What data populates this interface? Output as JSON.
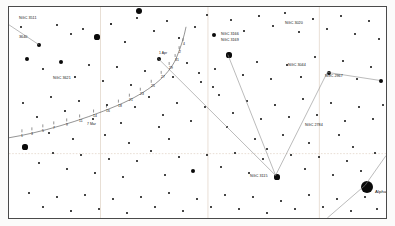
{
  "chart": {
    "kind": "star-chart",
    "title_visible": false,
    "frame": {
      "border_color": "#4a4a4a",
      "background": "#ffffff"
    }
  },
  "colors": {
    "star": "#0a0a0a",
    "grid": "#d9c9b8",
    "track": "#3a3a3a",
    "connector": "#8c8c8c",
    "label": "#111111"
  },
  "deep_sky_labels": [
    {
      "id": "ngc-3511",
      "text": "NGC 3511",
      "x": 10,
      "y": 10
    },
    {
      "id": "n-3640",
      "text": "3640",
      "x": 10,
      "y": 29
    },
    {
      "id": "ngc-3621",
      "text": "NGC 3621",
      "x": 44,
      "y": 70
    },
    {
      "id": "ngc-3166",
      "text": "NGC 3166",
      "x": 212,
      "y": 26
    },
    {
      "id": "ngc-3169",
      "text": "NGC 3169",
      "x": 212,
      "y": 32
    },
    {
      "id": "ngc-3020",
      "text": "NGC 3020",
      "x": 276,
      "y": 15
    },
    {
      "id": "ngc-3044",
      "text": "NGC 3044",
      "x": 279,
      "y": 57
    },
    {
      "id": "ngc-2967",
      "text": "NGC 2967",
      "x": 316,
      "y": 68
    },
    {
      "id": "ngc-2784",
      "text": "NGC 2784",
      "x": 296,
      "y": 117
    },
    {
      "id": "ngc-3115",
      "text": "NGC 3115",
      "x": 241,
      "y": 168
    }
  ],
  "star_names": [
    {
      "id": "alphard",
      "text": "Alphard",
      "x": 366,
      "y": 183
    }
  ],
  "track": {
    "label": "comet-track",
    "epoch_label": {
      "text": "7 Mar",
      "x": 78,
      "y": 116
    },
    "date_ticks": [
      {
        "day": "1",
        "x": 12,
        "y": 128
      },
      {
        "day": "3",
        "x": 22,
        "y": 126
      },
      {
        "day": "5",
        "x": 33,
        "y": 123
      },
      {
        "day": "7",
        "x": 44,
        "y": 120
      },
      {
        "day": "9",
        "x": 57,
        "y": 117
      },
      {
        "day": "11",
        "x": 70,
        "y": 113
      },
      {
        "day": "14",
        "x": 84,
        "y": 108
      },
      {
        "day": "16",
        "x": 97,
        "y": 103
      },
      {
        "day": "18",
        "x": 109,
        "y": 98
      },
      {
        "day": "21",
        "x": 120,
        "y": 92
      },
      {
        "day": "23",
        "x": 131,
        "y": 86
      },
      {
        "day": "25",
        "x": 142,
        "y": 78
      },
      {
        "day": "27",
        "x": 152,
        "y": 69
      },
      {
        "day": "29",
        "x": 160,
        "y": 60
      },
      {
        "day": "31",
        "x": 166,
        "y": 52
      },
      {
        "day": "2",
        "x": 170,
        "y": 44
      },
      {
        "day": "4",
        "x": 174,
        "y": 36
      }
    ],
    "secondary_label": {
      "text": "1 Apr",
      "x": 150,
      "y": 45
    }
  },
  "chart_data": {
    "type": "scatter",
    "xlabel": "Right Ascension",
    "ylabel": "Declination",
    "grid": true,
    "legend": "none",
    "xlim": [
      0,
      379
    ],
    "ylim": [
      0,
      213
    ],
    "series": [
      {
        "name": "stars",
        "note": "x,y in frame pixels; r = plotted radius proportional to brightness",
        "points": [
          {
            "x": 30,
            "y": 38,
            "r": 2.4
          },
          {
            "x": 12,
            "y": 20,
            "r": 1.0
          },
          {
            "x": 48,
            "y": 18,
            "r": 1.0
          },
          {
            "x": 62,
            "y": 27,
            "r": 1.0
          },
          {
            "x": 74,
            "y": 22,
            "r": 1.1
          },
          {
            "x": 88,
            "y": 30,
            "r": 2.6
          },
          {
            "x": 102,
            "y": 17,
            "r": 0.8
          },
          {
            "x": 116,
            "y": 35,
            "r": 0.9
          },
          {
            "x": 128,
            "y": 11,
            "r": 1.0
          },
          {
            "x": 130,
            "y": 4,
            "r": 3.0
          },
          {
            "x": 145,
            "y": 24,
            "r": 1.0
          },
          {
            "x": 158,
            "y": 14,
            "r": 1.0
          },
          {
            "x": 170,
            "y": 31,
            "r": 0.9
          },
          {
            "x": 186,
            "y": 20,
            "r": 1.2
          },
          {
            "x": 198,
            "y": 8,
            "r": 1.0
          },
          {
            "x": 205,
            "y": 28,
            "r": 2.2
          },
          {
            "x": 222,
            "y": 13,
            "r": 1.0
          },
          {
            "x": 235,
            "y": 24,
            "r": 1.1
          },
          {
            "x": 250,
            "y": 9,
            "r": 0.9
          },
          {
            "x": 264,
            "y": 19,
            "r": 1.0
          },
          {
            "x": 276,
            "y": 6,
            "r": 1.2
          },
          {
            "x": 290,
            "y": 25,
            "r": 1.0
          },
          {
            "x": 304,
            "y": 12,
            "r": 0.9
          },
          {
            "x": 318,
            "y": 22,
            "r": 1.1
          },
          {
            "x": 332,
            "y": 9,
            "r": 1.0
          },
          {
            "x": 346,
            "y": 27,
            "r": 1.2
          },
          {
            "x": 360,
            "y": 14,
            "r": 1.0
          },
          {
            "x": 370,
            "y": 32,
            "r": 1.4
          },
          {
            "x": 18,
            "y": 52,
            "r": 2.0
          },
          {
            "x": 34,
            "y": 62,
            "r": 1.0
          },
          {
            "x": 52,
            "y": 55,
            "r": 2.2
          },
          {
            "x": 66,
            "y": 70,
            "r": 0.9
          },
          {
            "x": 80,
            "y": 58,
            "r": 1.0
          },
          {
            "x": 94,
            "y": 74,
            "r": 1.1
          },
          {
            "x": 108,
            "y": 60,
            "r": 0.9
          },
          {
            "x": 122,
            "y": 78,
            "r": 1.0
          },
          {
            "x": 136,
            "y": 64,
            "r": 1.1
          },
          {
            "x": 150,
            "y": 52,
            "r": 2.0
          },
          {
            "x": 164,
            "y": 70,
            "r": 1.0
          },
          {
            "x": 178,
            "y": 56,
            "r": 1.0
          },
          {
            "x": 192,
            "y": 75,
            "r": 1.0
          },
          {
            "x": 206,
            "y": 62,
            "r": 1.2
          },
          {
            "x": 220,
            "y": 48,
            "r": 2.6
          },
          {
            "x": 234,
            "y": 68,
            "r": 0.9
          },
          {
            "x": 248,
            "y": 55,
            "r": 1.0
          },
          {
            "x": 262,
            "y": 72,
            "r": 1.0
          },
          {
            "x": 278,
            "y": 58,
            "r": 1.1
          },
          {
            "x": 292,
            "y": 70,
            "r": 0.9
          },
          {
            "x": 306,
            "y": 50,
            "r": 1.0
          },
          {
            "x": 320,
            "y": 66,
            "r": 2.4
          },
          {
            "x": 334,
            "y": 54,
            "r": 1.0
          },
          {
            "x": 348,
            "y": 72,
            "r": 1.0
          },
          {
            "x": 362,
            "y": 60,
            "r": 1.1
          },
          {
            "x": 372,
            "y": 74,
            "r": 2.2
          },
          {
            "x": 14,
            "y": 96,
            "r": 1.0
          },
          {
            "x": 28,
            "y": 110,
            "r": 1.0
          },
          {
            "x": 42,
            "y": 90,
            "r": 1.1
          },
          {
            "x": 56,
            "y": 104,
            "r": 0.9
          },
          {
            "x": 70,
            "y": 94,
            "r": 1.0
          },
          {
            "x": 84,
            "y": 112,
            "r": 1.0
          },
          {
            "x": 98,
            "y": 98,
            "r": 0.9
          },
          {
            "x": 112,
            "y": 116,
            "r": 1.0
          },
          {
            "x": 126,
            "y": 100,
            "r": 1.1
          },
          {
            "x": 140,
            "y": 90,
            "r": 1.0
          },
          {
            "x": 154,
            "y": 108,
            "r": 1.0
          },
          {
            "x": 168,
            "y": 96,
            "r": 1.0
          },
          {
            "x": 182,
            "y": 114,
            "r": 1.2
          },
          {
            "x": 196,
            "y": 100,
            "r": 1.0
          },
          {
            "x": 210,
            "y": 88,
            "r": 1.0
          },
          {
            "x": 224,
            "y": 106,
            "r": 1.0
          },
          {
            "x": 238,
            "y": 94,
            "r": 1.0
          },
          {
            "x": 252,
            "y": 112,
            "r": 1.1
          },
          {
            "x": 266,
            "y": 98,
            "r": 0.9
          },
          {
            "x": 280,
            "y": 110,
            "r": 1.0
          },
          {
            "x": 294,
            "y": 92,
            "r": 1.0
          },
          {
            "x": 308,
            "y": 108,
            "r": 1.0
          },
          {
            "x": 322,
            "y": 96,
            "r": 1.1
          },
          {
            "x": 336,
            "y": 114,
            "r": 1.0
          },
          {
            "x": 350,
            "y": 100,
            "r": 1.0
          },
          {
            "x": 364,
            "y": 112,
            "r": 1.2
          },
          {
            "x": 374,
            "y": 98,
            "r": 1.0
          },
          {
            "x": 16,
            "y": 140,
            "r": 2.6
          },
          {
            "x": 30,
            "y": 156,
            "r": 1.0
          },
          {
            "x": 44,
            "y": 146,
            "r": 1.0
          },
          {
            "x": 58,
            "y": 162,
            "r": 1.1
          },
          {
            "x": 72,
            "y": 148,
            "r": 1.0
          },
          {
            "x": 86,
            "y": 166,
            "r": 0.9
          },
          {
            "x": 100,
            "y": 152,
            "r": 1.0
          },
          {
            "x": 114,
            "y": 170,
            "r": 1.0
          },
          {
            "x": 128,
            "y": 154,
            "r": 1.1
          },
          {
            "x": 142,
            "y": 144,
            "r": 1.0
          },
          {
            "x": 156,
            "y": 168,
            "r": 1.0
          },
          {
            "x": 170,
            "y": 150,
            "r": 1.0
          },
          {
            "x": 184,
            "y": 164,
            "r": 2.4
          },
          {
            "x": 198,
            "y": 148,
            "r": 1.0
          },
          {
            "x": 212,
            "y": 160,
            "r": 1.2
          },
          {
            "x": 226,
            "y": 146,
            "r": 1.0
          },
          {
            "x": 240,
            "y": 166,
            "r": 1.0
          },
          {
            "x": 254,
            "y": 152,
            "r": 1.0
          },
          {
            "x": 268,
            "y": 170,
            "r": 2.6
          },
          {
            "x": 282,
            "y": 148,
            "r": 1.0
          },
          {
            "x": 296,
            "y": 162,
            "r": 1.0
          },
          {
            "x": 310,
            "y": 150,
            "r": 1.1
          },
          {
            "x": 324,
            "y": 168,
            "r": 1.0
          },
          {
            "x": 338,
            "y": 154,
            "r": 1.0
          },
          {
            "x": 352,
            "y": 164,
            "r": 1.0
          },
          {
            "x": 366,
            "y": 146,
            "r": 1.2
          },
          {
            "x": 20,
            "y": 186,
            "r": 1.0
          },
          {
            "x": 34,
            "y": 200,
            "r": 1.1
          },
          {
            "x": 48,
            "y": 190,
            "r": 1.0
          },
          {
            "x": 62,
            "y": 204,
            "r": 0.9
          },
          {
            "x": 76,
            "y": 188,
            "r": 1.0
          },
          {
            "x": 90,
            "y": 202,
            "r": 1.0
          },
          {
            "x": 104,
            "y": 192,
            "r": 1.0
          },
          {
            "x": 118,
            "y": 206,
            "r": 1.0
          },
          {
            "x": 132,
            "y": 190,
            "r": 1.1
          },
          {
            "x": 146,
            "y": 200,
            "r": 1.0
          },
          {
            "x": 160,
            "y": 186,
            "r": 1.0
          },
          {
            "x": 174,
            "y": 204,
            "r": 1.0
          },
          {
            "x": 188,
            "y": 192,
            "r": 1.0
          },
          {
            "x": 202,
            "y": 200,
            "r": 1.1
          },
          {
            "x": 216,
            "y": 188,
            "r": 1.0
          },
          {
            "x": 230,
            "y": 202,
            "r": 1.0
          },
          {
            "x": 244,
            "y": 190,
            "r": 1.0
          },
          {
            "x": 258,
            "y": 206,
            "r": 1.0
          },
          {
            "x": 272,
            "y": 194,
            "r": 1.0
          },
          {
            "x": 286,
            "y": 202,
            "r": 1.0
          },
          {
            "x": 300,
            "y": 188,
            "r": 1.0
          },
          {
            "x": 314,
            "y": 200,
            "r": 1.1
          },
          {
            "x": 328,
            "y": 192,
            "r": 1.0
          },
          {
            "x": 342,
            "y": 204,
            "r": 1.0
          },
          {
            "x": 356,
            "y": 190,
            "r": 1.0
          },
          {
            "x": 368,
            "y": 202,
            "r": 1.0
          },
          {
            "x": 358,
            "y": 180,
            "r": 6.0
          },
          {
            "x": 190,
            "y": 66,
            "r": 1.0
          },
          {
            "x": 204,
            "y": 80,
            "r": 1.0
          },
          {
            "x": 218,
            "y": 120,
            "r": 1.0
          },
          {
            "x": 246,
            "y": 132,
            "r": 1.0
          },
          {
            "x": 258,
            "y": 142,
            "r": 1.0
          },
          {
            "x": 274,
            "y": 128,
            "r": 1.0
          },
          {
            "x": 300,
            "y": 136,
            "r": 1.0
          },
          {
            "x": 330,
            "y": 128,
            "r": 1.0
          },
          {
            "x": 344,
            "y": 140,
            "r": 1.0
          },
          {
            "x": 150,
            "y": 120,
            "r": 1.0
          },
          {
            "x": 160,
            "y": 132,
            "r": 1.0
          },
          {
            "x": 120,
            "y": 136,
            "r": 1.0
          },
          {
            "x": 96,
            "y": 128,
            "r": 1.0
          },
          {
            "x": 64,
            "y": 132,
            "r": 1.0
          },
          {
            "x": 40,
            "y": 126,
            "r": 1.0
          }
        ]
      }
    ],
    "annotations": [
      "NGC 3511",
      "3640",
      "NGC 3621",
      "NGC 3166",
      "NGC 3169",
      "NGC 3020",
      "NGC 3044",
      "NGC 2967",
      "NGC 2784",
      "NGC 3115",
      "Alphard",
      "7 Mar",
      "1 Apr"
    ],
    "gridlines": {
      "vertical_x": [
        92,
        200,
        312
      ],
      "horizontal_y": [
        148
      ]
    }
  }
}
